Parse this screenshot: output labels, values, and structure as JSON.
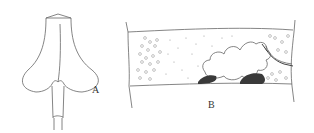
{
  "figure": {
    "panels": [
      {
        "id": "A",
        "label": "A",
        "description": "flask-shaped structure with two lateral lobes on a narrow stalk"
      },
      {
        "id": "B",
        "label": "B",
        "description": "tubular segment with stippled granules, cloud-like mass and dark deposits"
      }
    ],
    "colors": {
      "line": "#555555",
      "dark": "#3a3a3a",
      "background": "#ffffff"
    }
  }
}
